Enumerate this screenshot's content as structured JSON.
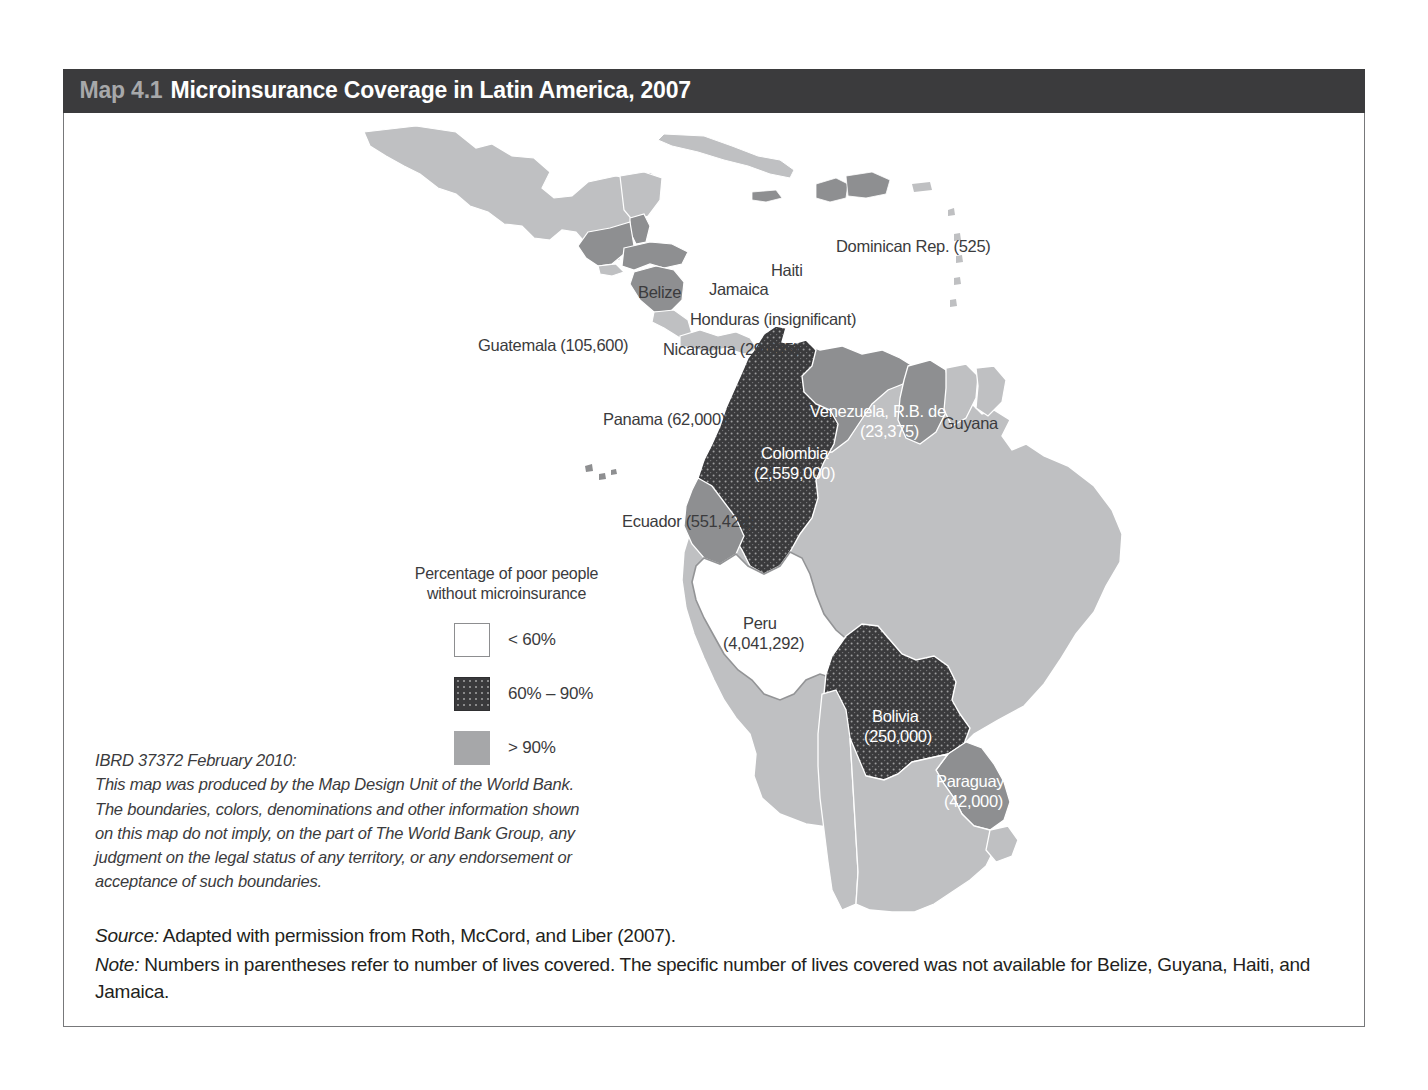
{
  "figure": {
    "number": "Map 4.1",
    "title": "Microinsurance Coverage in Latin America, 2007"
  },
  "legend": {
    "title_line1": "Percentage of poor people",
    "title_line2": "without microinsurance",
    "items": [
      {
        "label": "< 60%",
        "swatch": "white",
        "color": "#ffffff"
      },
      {
        "label": "60% – 90%",
        "swatch": "dark-dotted",
        "color": "#3a3a3c"
      },
      {
        "label": "> 90%",
        "swatch": "gray",
        "color": "#a6a7a9"
      }
    ]
  },
  "ibrd": {
    "line1": "IBRD 37372 February 2010:",
    "line2": "This map was produced by the Map Design Unit of the World Bank.",
    "line3": "The boundaries, colors, denominations and other information shown",
    "line4": "on this map do not imply, on the part of The World Bank Group, any",
    "line5": "judgment on the legal status of any territory, or any endorsement or",
    "line6": "acceptance of such boundaries."
  },
  "source": {
    "lead": "Source:",
    "text": " Adapted with permission from Roth, McCord, and Liber (2007)."
  },
  "note": {
    "lead": "Note:",
    "text": " Numbers in parentheses refer to number of lives covered. The specific number of lives covered was not available for Belize, Guyana, Haiti, and Jamaica."
  },
  "map_data": {
    "type": "choropleth",
    "region": "Latin America and the Caribbean",
    "value_label": "Percentage of poor people without microinsurance",
    "countries": [
      {
        "name": "Guatemala",
        "label": "Guatemala (105,600)",
        "lives_covered": 105600,
        "category": "60% – 90%",
        "label_style": "dark"
      },
      {
        "name": "Belize",
        "label": "Belize",
        "lives_covered": null,
        "category": "60% – 90%",
        "label_style": "dark"
      },
      {
        "name": "Honduras",
        "label": "Honduras (insignificant)",
        "lives_covered": "insignificant",
        "category": "60% – 90%",
        "label_style": "dark"
      },
      {
        "name": "Nicaragua",
        "label": "Nicaragua (29,035)",
        "lives_covered": 29035,
        "category": "60% – 90%",
        "label_style": "dark"
      },
      {
        "name": "Jamaica",
        "label": "Jamaica",
        "lives_covered": null,
        "category": "60% – 90%",
        "label_style": "dark"
      },
      {
        "name": "Haiti",
        "label": "Haiti",
        "lives_covered": null,
        "category": "60% – 90%",
        "label_style": "dark"
      },
      {
        "name": "Dominican Rep.",
        "label": "Dominican Rep. (525)",
        "lives_covered": 525,
        "category": "60% – 90%",
        "label_style": "dark"
      },
      {
        "name": "Panama",
        "label": "Panama (62,000)",
        "lives_covered": 62000,
        "category": "> 90%",
        "label_style": "dark"
      },
      {
        "name": "Colombia",
        "label_line1": "Colombia",
        "label_line2": "(2,559,000)",
        "lives_covered": 2559000,
        "category": "60% – 90%",
        "label_style": "light"
      },
      {
        "name": "Venezuela, R.B. de",
        "label_line1": "Venezuela, R.B. de",
        "label_line2": "(23,375)",
        "lives_covered": 23375,
        "category": "> 90%",
        "label_style": "light"
      },
      {
        "name": "Guyana",
        "label": "Guyana",
        "lives_covered": null,
        "category": "> 90%",
        "label_style": "dark"
      },
      {
        "name": "Ecuador",
        "label": "Ecuador (551,422)",
        "lives_covered": 551422,
        "category": "> 90%",
        "label_style": "dark"
      },
      {
        "name": "Peru",
        "label_line1": "Peru",
        "label_line2": "(4,041,292)",
        "lives_covered": 4041292,
        "category": "< 60%",
        "label_style": "dark"
      },
      {
        "name": "Bolivia",
        "label_line1": "Bolivia",
        "label_line2": "(250,000)",
        "lives_covered": 250000,
        "category": "60% – 90%",
        "label_style": "light"
      },
      {
        "name": "Paraguay",
        "label_line1": "Paraguay",
        "label_line2": "(42,000)",
        "lives_covered": 42000,
        "category": "> 90%",
        "label_style": "light"
      }
    ]
  }
}
